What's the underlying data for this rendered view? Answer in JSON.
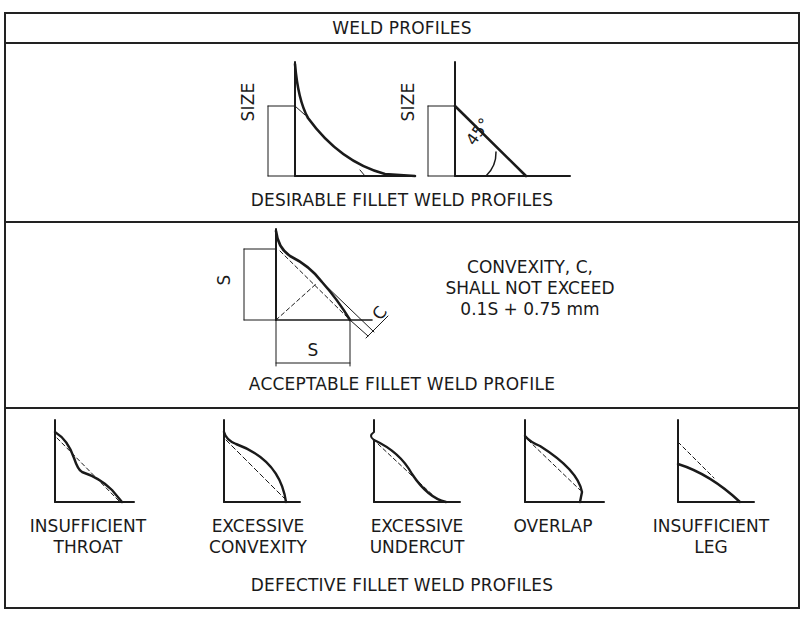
{
  "title": "WELD PROFILES",
  "sections": {
    "desirable": {
      "caption": "DESIRABLE FILLET WELD PROFILES",
      "labels": {
        "size_left": "SIZE",
        "size_right": "SIZE",
        "angle": "45°"
      }
    },
    "acceptable": {
      "caption": "ACCEPTABLE FILLET WELD PROFILE",
      "labels": {
        "s_vertical": "S",
        "s_horizontal": "S",
        "c": "C"
      },
      "note": [
        "CONVEXITY, C,",
        "SHALL NOT EXCEED",
        "0.1S + 0.75 mm"
      ]
    },
    "defective": {
      "caption": "DEFECTIVE FILLET WELD PROFILES",
      "items": [
        {
          "line1": "INSUFFICIENT",
          "line2": "THROAT"
        },
        {
          "line1": "EXCESSIVE",
          "line2": "CONVEXITY"
        },
        {
          "line1": "EXCESSIVE",
          "line2": "UNDERCUT"
        },
        {
          "line1": "OVERLAP",
          "line2": ""
        },
        {
          "line1": "INSUFFICIENT",
          "line2": "LEG"
        }
      ]
    }
  },
  "colors": {
    "line": "#1a1a1a",
    "background": "#ffffff"
  }
}
